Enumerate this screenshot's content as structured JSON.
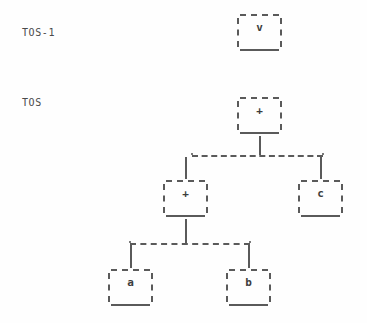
{
  "diagram": {
    "type": "binary-expression-tree",
    "background_color": "#fefefe",
    "line_color": "#5a5a5a",
    "text_color": "#3d3d3d",
    "row_labels": [
      {
        "id": "row-tos-1",
        "text": "TOS-1",
        "x": 22,
        "y": 27
      },
      {
        "id": "row-tos",
        "text": "TOS",
        "x": 22,
        "y": 97
      }
    ],
    "nodes": [
      {
        "id": "node-v",
        "label": "v",
        "x": 237,
        "y": 14,
        "row": "TOS-1"
      },
      {
        "id": "node-plus-root",
        "label": "+",
        "x": 237,
        "y": 97,
        "row": "TOS"
      },
      {
        "id": "node-plus-mid",
        "label": "+",
        "x": 163,
        "y": 180,
        "row": "TOS"
      },
      {
        "id": "node-c",
        "label": "c",
        "x": 298,
        "y": 180,
        "row": "TOS"
      },
      {
        "id": "node-a",
        "label": "a",
        "x": 108,
        "y": 269,
        "row": "TOS"
      },
      {
        "id": "node-b",
        "label": "b",
        "x": 226,
        "y": 269,
        "row": "TOS"
      }
    ],
    "edges": [
      {
        "id": "edge-root-stem",
        "from": "node-plus-root",
        "to": "bus-upper",
        "kind": "vertical"
      },
      {
        "id": "edge-bus-upper",
        "from": "bus-upper",
        "to": "bus-upper",
        "kind": "horizontal"
      },
      {
        "id": "edge-to-plus-mid",
        "from": "bus-upper",
        "to": "node-plus-mid",
        "kind": "vertical"
      },
      {
        "id": "edge-to-c",
        "from": "bus-upper",
        "to": "node-c",
        "kind": "vertical"
      },
      {
        "id": "edge-mid-stem",
        "from": "node-plus-mid",
        "to": "bus-lower",
        "kind": "vertical"
      },
      {
        "id": "edge-bus-lower",
        "from": "bus-lower",
        "to": "bus-lower",
        "kind": "horizontal"
      },
      {
        "id": "edge-to-a",
        "from": "bus-lower",
        "to": "node-a",
        "kind": "vertical"
      },
      {
        "id": "edge-to-b",
        "from": "bus-lower",
        "to": "node-b",
        "kind": "vertical"
      }
    ]
  }
}
